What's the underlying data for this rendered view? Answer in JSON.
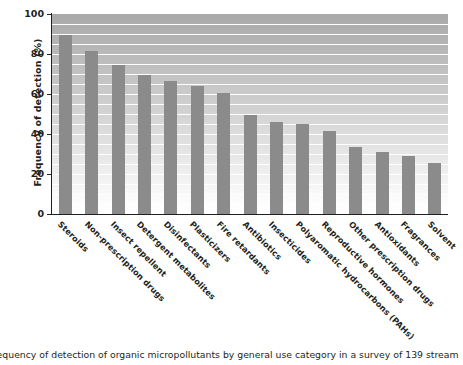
{
  "chart_data": {
    "type": "bar",
    "title": "",
    "xlabel": "",
    "ylabel": "Frequency of detection (%)",
    "ylim": [
      0,
      100
    ],
    "yticks": [
      0,
      20,
      40,
      60,
      80,
      100
    ],
    "grid": true,
    "gridline_interval": 5,
    "legend": null,
    "bar_color": "#8b8b8b",
    "categories": [
      "Steroids",
      "Non-prescription drugs",
      "Insect repellent",
      "Detergent metabolites",
      "Disinfectants",
      "Plasticizers",
      "Fire retardants",
      "Antibiotics",
      "Insecticides",
      "Polyaromatic hydrocarbons (PAHs)",
      "Reproductive hormones",
      "Other prescription drugs",
      "Antioxidants",
      "Fragrances",
      "Solvent"
    ],
    "values": [
      89.5,
      81.5,
      74.5,
      69.5,
      66.5,
      64,
      60.5,
      49.5,
      46,
      45,
      41.5,
      33.5,
      31,
      29,
      25.5
    ]
  },
  "axis": {
    "y_title": "Frequency of detection (%)",
    "y_tick_labels": [
      "100",
      "80",
      "60",
      "40",
      "20",
      "0"
    ]
  },
  "caption": {
    "text": "requency of detection of organic micropollutants by general use category in a survey of 139 stream"
  }
}
